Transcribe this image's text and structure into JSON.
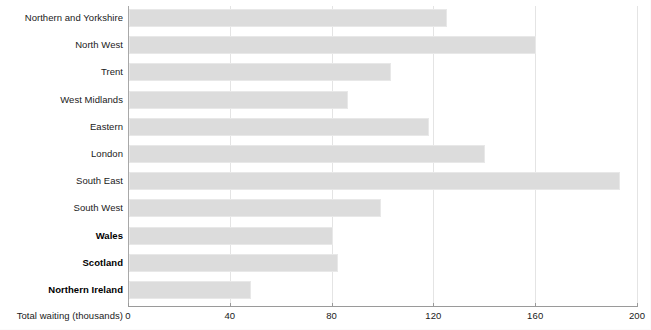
{
  "chart_data": {
    "type": "bar",
    "orientation": "horizontal",
    "title": "",
    "xlabel": "Total waiting (thousands)",
    "ylabel": "",
    "xlim": [
      0,
      200
    ],
    "xticks": [
      0,
      40,
      80,
      120,
      160,
      200
    ],
    "xtick_labels": [
      "0",
      "40",
      "80",
      "120",
      "160",
      "200"
    ],
    "grid": "vertical",
    "legend": "none",
    "bar_color": "#dcdcdc",
    "bar_edge_color": "#e8e8e8",
    "axis_color": "#9a9a9a",
    "gridline_color": "#e4e4e4",
    "categories": [
      "Northern and Yorkshire",
      "North West",
      "Trent",
      "West Midlands",
      "Eastern",
      "London",
      "South East",
      "South West",
      "Wales",
      "Scotland",
      "Northern Ireland"
    ],
    "values": [
      125,
      160,
      103,
      86,
      118,
      140,
      193,
      99,
      80,
      82,
      48
    ],
    "emphasised_categories": [
      "Wales",
      "Scotland",
      "Northern Ireland"
    ]
  },
  "axis": {
    "title": "Total waiting (thousands)"
  }
}
